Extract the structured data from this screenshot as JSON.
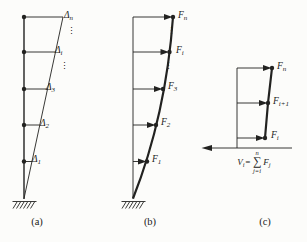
{
  "figure": {
    "colors": {
      "ink": "#222220",
      "paper": "#fcfcfa"
    },
    "panels": {
      "a": {
        "caption": "(a)",
        "ellipsis": "⋮",
        "displacement_labels": [
          {
            "base": "Δ",
            "sub": "n"
          },
          {
            "base": "Δ",
            "sub": "i"
          },
          {
            "base": "Δ",
            "sub": "3"
          },
          {
            "base": "Δ",
            "sub": "2"
          },
          {
            "base": "Δ",
            "sub": "1"
          }
        ]
      },
      "b": {
        "caption": "(b)",
        "ellipsis": "⋮",
        "force_labels": [
          {
            "base": "F",
            "sub": "n"
          },
          {
            "base": "F",
            "sub": "i"
          },
          {
            "base": "F",
            "sub": "3"
          },
          {
            "base": "F",
            "sub": "2"
          },
          {
            "base": "F",
            "sub": "1"
          }
        ]
      },
      "c": {
        "caption": "(c)",
        "force_labels": [
          {
            "base": "F",
            "sub": "n"
          },
          {
            "base": "F",
            "sub": "i+1"
          },
          {
            "base": "F",
            "sub": "i"
          }
        ],
        "shear_equation": {
          "lhs_base": "V",
          "lhs_sub": "i",
          "equals": "=",
          "sum_upper": "n",
          "sum_symbol": "∑",
          "sum_lower": "j=i",
          "rhs_base": "F",
          "rhs_sub": "j"
        }
      }
    }
  }
}
